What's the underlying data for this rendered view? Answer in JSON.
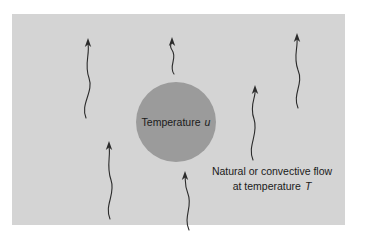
{
  "figure": {
    "name": "convection-around-heated-sphere",
    "background_color": "#ffffff",
    "panel": {
      "name": "diagram-panel",
      "fill": "#d4d4d4",
      "x": 12,
      "y": 14,
      "width": 333,
      "height": 211
    },
    "sphere": {
      "name": "heated-sphere",
      "fill": "#9b9b9b",
      "cx": 176,
      "cy": 122,
      "r": 40,
      "label_text": "Temperature",
      "label_symbol": "u"
    },
    "caption": {
      "name": "flow-caption",
      "line1": "Natural or convective flow",
      "line2_prefix": "at temperature",
      "line2_symbol": "T",
      "x": 272,
      "line1_y": 175,
      "line2_y": 190
    },
    "flow_arrows": {
      "name": "convective-flow-arrows",
      "stroke": "#2b2b2b",
      "stroke_width": 1.1,
      "count": 6,
      "items": [
        {
          "name": "flow-arrow-upper-left",
          "path": "M 86 118 C 80 104 94 92 89 78 C 84 64 90 54 88 44",
          "tip_x": 88,
          "tip_y": 40,
          "direction": "up"
        },
        {
          "name": "flow-arrow-top-center",
          "path": "M 174 74 C 168 66 178 58 172 50 C 169 46 171 44 172 42",
          "tip_x": 172,
          "tip_y": 39,
          "direction": "up"
        },
        {
          "name": "flow-arrow-top-right",
          "path": "M 298 108 C 292 94 304 84 298 70 C 293 57 298 48 297 39",
          "tip_x": 297,
          "tip_y": 35,
          "direction": "up"
        },
        {
          "name": "flow-arrow-right-middle",
          "path": "M 253 160 C 247 146 259 134 254 119 C 249 105 256 97 255 91",
          "tip_x": 255,
          "tip_y": 88,
          "direction": "up"
        },
        {
          "name": "flow-arrow-lower-left",
          "path": "M 110 219 C 104 205 116 194 111 180 C 106 166 111 155 109 147",
          "tip_x": 109,
          "tip_y": 143,
          "direction": "up"
        },
        {
          "name": "flow-arrow-bottom-center",
          "path": "M 189 230 C 183 217 193 206 188 194 C 184 184 186 180 185 177",
          "tip_x": 185,
          "tip_y": 173,
          "direction": "up"
        }
      ]
    }
  }
}
